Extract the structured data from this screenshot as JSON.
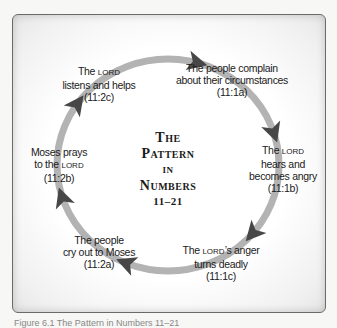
{
  "diagram": {
    "title": {
      "line1": "The",
      "line2": "Pattern",
      "line3": "in",
      "line4": "Numbers",
      "line5": "11–21"
    },
    "colors": {
      "ring": "#b3b3b3",
      "arrow": "#474747",
      "text": "#1a1a1a"
    },
    "steps": [
      {
        "lines": [
          "The people complain",
          "about their circumstances",
          "(11:1a)"
        ]
      },
      {
        "pre": "The ",
        "lord": "Lord",
        "post": "",
        "lines": [
          "hears and",
          "becomes angry",
          "(11:1b)"
        ]
      },
      {
        "pre": "The ",
        "lord": "Lord",
        "post": "’s anger",
        "lines": [
          "turns deadly",
          "(11:1c)"
        ]
      },
      {
        "lines": [
          "The people",
          "cry out to Moses",
          "(11:2a)"
        ]
      },
      {
        "first": "Moses prays",
        "pre": "to the ",
        "lord": "Lord",
        "post": "",
        "lines": [
          "(11:2b)"
        ]
      },
      {
        "pre": "The ",
        "lord": "Lord",
        "post": "",
        "lines": [
          "listens and helps",
          "(11:2c)"
        ]
      }
    ],
    "caption": "Figure 6.1 The Pattern in Numbers 11–21"
  }
}
